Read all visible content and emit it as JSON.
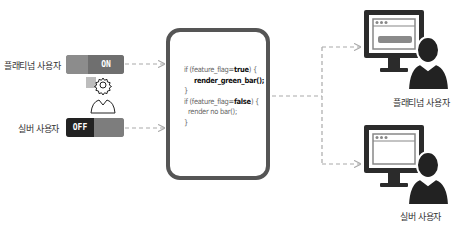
{
  "users": {
    "platinum_label": "플래티넘 사용자",
    "silver_label": "실버 사용자"
  },
  "toggles": {
    "platinum": {
      "state": "ON"
    },
    "silver": {
      "state": "OFF"
    }
  },
  "admin_icon": "gear-person-icon",
  "code": {
    "line1_prefix": "if (feature_flag=",
    "line1_value": "true",
    "line1_suffix": ") {",
    "line2": "render_green_bar();",
    "line3": "}",
    "line4_prefix": "if (feature_flag=",
    "line4_value": "false",
    "line4_suffix": ") {",
    "line5": "render no bar();",
    "line6": "}"
  },
  "outputs": {
    "platinum_caption": "플래티넘 사용자",
    "silver_caption": "실버 사용자"
  },
  "colors": {
    "frame": "#555555",
    "monitor": "#2b2b2b",
    "arrow": "#aaaaaa",
    "bar": "#8a8a8a"
  }
}
